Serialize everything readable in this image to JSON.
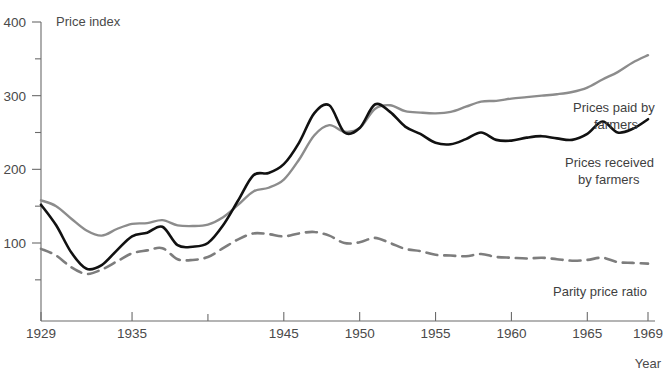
{
  "chart_data": {
    "type": "line",
    "title": "",
    "xlabel": "Year",
    "ylabel": "Price index",
    "xlim": [
      1929,
      1969
    ],
    "ylim": [
      40,
      400
    ],
    "grid": false,
    "legend_position": "inline-right-annotations",
    "y_ticks": [
      50,
      100,
      150,
      200,
      250,
      300,
      350,
      400
    ],
    "y_tick_labels": [
      "",
      "100",
      "",
      "200",
      "",
      "300",
      "",
      "400"
    ],
    "x_ticks": [
      1929,
      1935,
      1940,
      1945,
      1950,
      1955,
      1960,
      1965,
      1969
    ],
    "x_tick_labels": [
      "1929",
      "1935",
      "",
      "1945",
      "1950",
      "1955",
      "1960",
      "1965",
      "1969"
    ],
    "colors": {
      "prices_received": "#111111",
      "prices_paid": "#8c8c8c",
      "parity_price_ratio": "#7d7d7d",
      "axis": "#6b6b6b",
      "background": "#ffffff"
    },
    "x": [
      1929,
      1930,
      1931,
      1932,
      1933,
      1934,
      1935,
      1936,
      1937,
      1938,
      1939,
      1940,
      1941,
      1942,
      1943,
      1944,
      1945,
      1946,
      1947,
      1948,
      1949,
      1950,
      1951,
      1952,
      1953,
      1954,
      1955,
      1956,
      1957,
      1958,
      1959,
      1960,
      1961,
      1962,
      1963,
      1964,
      1965,
      1966,
      1967,
      1968,
      1969
    ],
    "series": [
      {
        "name": "Prices received by farmers",
        "style": "solid",
        "color": "#111111",
        "values": [
          152,
          124,
          87,
          65,
          70,
          90,
          109,
          114,
          122,
          97,
          95,
          100,
          124,
          158,
          192,
          195,
          207,
          236,
          276,
          287,
          250,
          256,
          288,
          278,
          258,
          248,
          236,
          234,
          241,
          250,
          240,
          239,
          243,
          245,
          242,
          240,
          248,
          265,
          250,
          255,
          268
        ]
      },
      {
        "name": "Prices paid by farmers",
        "style": "solid",
        "color": "#8c8c8c",
        "values": [
          158,
          150,
          133,
          117,
          110,
          119,
          126,
          127,
          131,
          124,
          123,
          125,
          135,
          152,
          170,
          175,
          186,
          213,
          246,
          260,
          251,
          256,
          282,
          287,
          279,
          277,
          276,
          278,
          285,
          292,
          293,
          296,
          298,
          300,
          302,
          305,
          311,
          322,
          332,
          345,
          355
        ]
      },
      {
        "name": "Parity price ratio",
        "style": "dashed",
        "color": "#7d7d7d",
        "values": [
          92,
          83,
          67,
          58,
          64,
          75,
          86,
          90,
          93,
          78,
          77,
          81,
          93,
          105,
          113,
          112,
          109,
          113,
          115,
          110,
          100,
          101,
          107,
          100,
          92,
          89,
          84,
          83,
          82,
          85,
          81,
          80,
          79,
          80,
          78,
          76,
          77,
          80,
          74,
          73,
          72
        ]
      }
    ]
  },
  "annotations": {
    "prices_paid_label_line1": "Prices paid by",
    "prices_paid_label_line2": "farmers",
    "prices_received_label_line1": "Prices received",
    "prices_received_label_line2": "by farmers",
    "parity_label": "Parity price ratio"
  },
  "axis": {
    "y_title": "Price index",
    "x_title": "Year"
  }
}
